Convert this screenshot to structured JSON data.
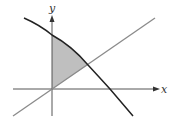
{
  "diagram": {
    "axes": {
      "x_label": "x",
      "y_label": "y"
    },
    "curves": [
      {
        "name": "decreasing-concave-curve",
        "color": "#222222"
      },
      {
        "name": "straight-line-through-origin",
        "color": "#888888"
      }
    ],
    "shaded_region": {
      "description": "Region bounded by y-axis, the line, and the curve",
      "fill": "#bdbdbd"
    },
    "colors": {
      "axis": "#555555",
      "curve": "#222222",
      "line": "#8a8a8a",
      "shade": "#bfbfbf"
    }
  }
}
